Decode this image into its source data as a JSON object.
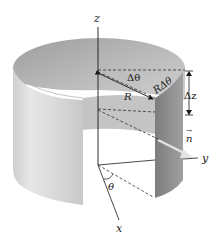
{
  "figure": {
    "labels": {
      "z_axis": "z",
      "y_axis": "y",
      "x_axis": "x",
      "radius": "R",
      "delta_theta": "Δθ",
      "arc_length": "RΔθ",
      "delta_z": "Δz",
      "normal": "n",
      "normal_arrow": "→",
      "theta": "θ"
    },
    "colors": {
      "cylinder_outer": "#dcdcdc",
      "cylinder_inner": "#a9a9a9",
      "strip_dark": "#8c8c8c",
      "line": "#1a1a1a",
      "normal_arrow": "#e6e6e6"
    }
  }
}
